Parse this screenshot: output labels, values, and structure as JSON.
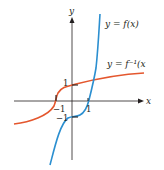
{
  "diagram": {
    "axes": {
      "x_label": "x",
      "y_label": "y"
    },
    "tick_labels": {
      "x_pos": "1",
      "x_neg": "−1",
      "y_pos": "1",
      "y_neg": "−1"
    },
    "curves": [
      {
        "name": "f",
        "label": "y = f(x)",
        "color": "#2b8fd0"
      },
      {
        "name": "f-inverse",
        "label": "y = f⁻¹(x",
        "color": "#e4572e"
      }
    ]
  }
}
